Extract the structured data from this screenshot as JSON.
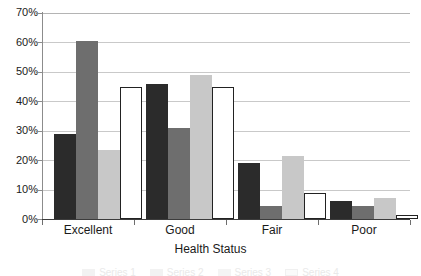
{
  "chart_data": {
    "type": "bar",
    "title": "",
    "xlabel": "Health Status",
    "ylabel": "",
    "categories": [
      "Excellent",
      "Good",
      "Fair",
      "Poor"
    ],
    "series": [
      {
        "name": "Series 1",
        "color": "#2b2b2b",
        "values": [
          29,
          46,
          19,
          6
        ]
      },
      {
        "name": "Series 2",
        "color": "#6e6e6e",
        "values": [
          60.5,
          31,
          4.5,
          4.5
        ]
      },
      {
        "name": "Series 3",
        "color": "#c8c8c8",
        "values": [
          23.5,
          49,
          21.5,
          7
        ]
      },
      {
        "name": "Series 4",
        "color": "#ffffff",
        "values": [
          45,
          45,
          9,
          1.5
        ]
      }
    ],
    "ylim": [
      0,
      70
    ],
    "ytick_labels": [
      "0%",
      "10%",
      "20%",
      "30%",
      "40%",
      "50%",
      "60%",
      "70%"
    ],
    "ytick_values": [
      0,
      10,
      20,
      30,
      40,
      50,
      60,
      70
    ],
    "grid": true,
    "legend_position": "bottom-cropped"
  },
  "axis": {
    "x_title": "Health Status"
  }
}
